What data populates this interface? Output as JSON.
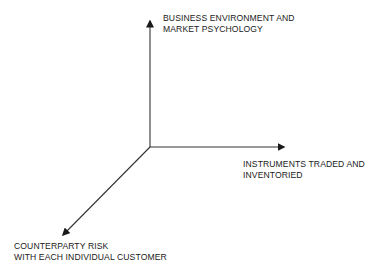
{
  "diagram": {
    "type": "3-axis conceptual diagram",
    "colors": {
      "line": "#333333",
      "text": "#1a1a1a",
      "background": "#ffffff"
    },
    "origin": {
      "x": 150,
      "y": 147
    },
    "axes": [
      {
        "id": "vertical",
        "direction": "up",
        "end": {
          "x": 150,
          "y": 20
        },
        "label_lines": [
          "BUSINESS ENVIRONMENT AND",
          "MARKET PSYCHOLOGY"
        ]
      },
      {
        "id": "horizontal",
        "direction": "right",
        "end": {
          "x": 285,
          "y": 147
        },
        "label_lines": [
          "INSTRUMENTS TRADED AND",
          "INVENTORIED"
        ]
      },
      {
        "id": "diagonal",
        "direction": "down-left",
        "end": {
          "x": 62,
          "y": 236
        },
        "label_lines": [
          "COUNTERPARTY RISK",
          "WITH EACH INDIVIDUAL CUSTOMER"
        ]
      }
    ]
  }
}
